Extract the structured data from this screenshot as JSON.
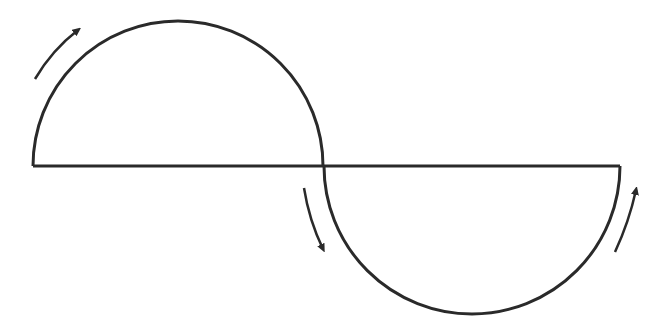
{
  "diagram": {
    "stroke_color": "#2a2a2a",
    "background": "#ffffff",
    "baseline": {
      "x1": 33,
      "x2": 620,
      "y": 166
    },
    "upper_semicircle": {
      "cx": 178,
      "cy": 166,
      "r": 145
    },
    "lower_semicircle": {
      "cx": 472,
      "cy": 166,
      "r": 148
    },
    "arrows": [
      {
        "name": "upper-left-arrow",
        "direction": "clockwise-up-right"
      },
      {
        "name": "center-down-arrow",
        "direction": "downward"
      },
      {
        "name": "lower-right-arrow",
        "direction": "upward"
      }
    ]
  }
}
